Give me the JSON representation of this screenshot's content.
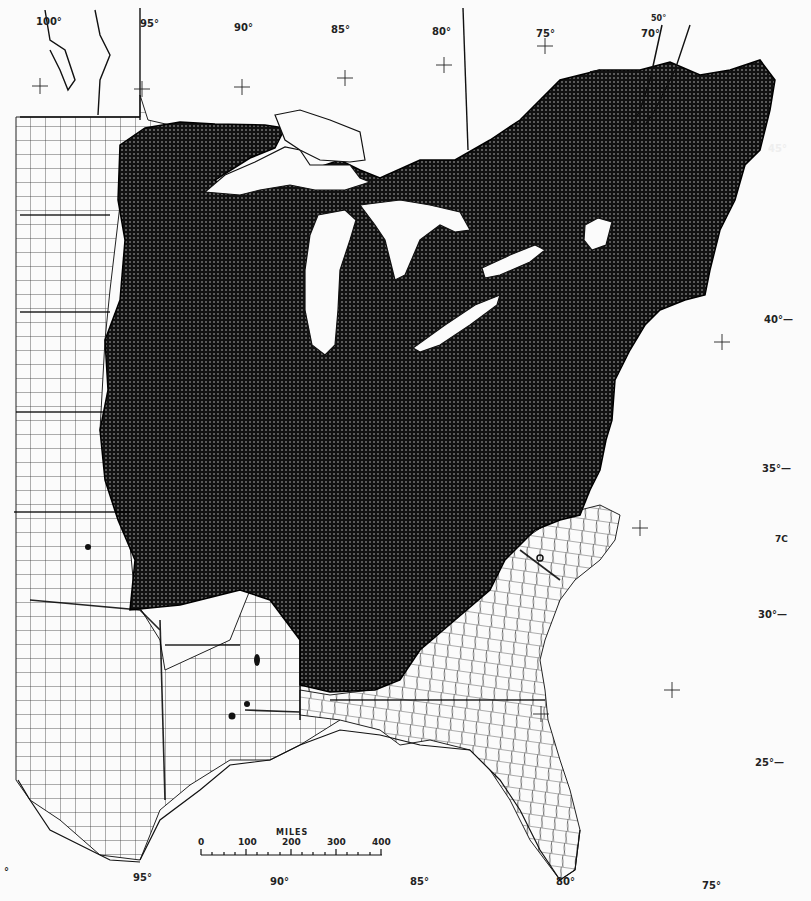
{
  "map": {
    "title": "",
    "subject": "Species distribution range (shaded) in eastern North America",
    "range_fill": "#111111",
    "range_dot_pattern": "#cfcfcf",
    "land_fill": "#fbfbfb",
    "line_color": "#1a1a1a"
  },
  "longitude_labels_top": [
    {
      "label": "100°",
      "x": 36,
      "y": 16
    },
    {
      "label": "95°",
      "x": 140,
      "y": 18
    },
    {
      "label": "90°",
      "x": 234,
      "y": 22
    },
    {
      "label": "85°",
      "x": 331,
      "y": 24
    },
    {
      "label": "80°",
      "x": 432,
      "y": 26
    },
    {
      "label": "75°",
      "x": 536,
      "y": 28
    },
    {
      "label": "70°",
      "x": 641,
      "y": 28
    },
    {
      "label": "50°",
      "x": 651,
      "y": 16
    }
  ],
  "longitude_labels_bottom": [
    {
      "label": "95°",
      "x": 133,
      "y": 872
    },
    {
      "label": "90°",
      "x": 270,
      "y": 876
    },
    {
      "label": "85°",
      "x": 410,
      "y": 876
    },
    {
      "label": "80°",
      "x": 556,
      "y": 876
    },
    {
      "label": "75°",
      "x": 702,
      "y": 880
    },
    {
      "label": "°",
      "x": 4,
      "y": 868
    }
  ],
  "latitude_labels_right": [
    {
      "label": "45°",
      "x": 768,
      "y": 143
    },
    {
      "label": "40°—",
      "x": 764,
      "y": 314
    },
    {
      "label": "35°—",
      "x": 762,
      "y": 463
    },
    {
      "label": "7C",
      "x": 775,
      "y": 534
    },
    {
      "label": "30°—",
      "x": 758,
      "y": 609
    },
    {
      "label": "25°—",
      "x": 755,
      "y": 757
    }
  ],
  "graticule_crosses": [
    {
      "x": 40,
      "y": 86
    },
    {
      "x": 142,
      "y": 89
    },
    {
      "x": 242,
      "y": 87
    },
    {
      "x": 345,
      "y": 78
    },
    {
      "x": 444,
      "y": 65
    },
    {
      "x": 545,
      "y": 46
    },
    {
      "x": 722,
      "y": 342
    },
    {
      "x": 640,
      "y": 528
    },
    {
      "x": 672,
      "y": 690
    },
    {
      "x": 541,
      "y": 714
    },
    {
      "x": 444,
      "y": 66
    }
  ],
  "scale_bar": {
    "title": "MILES",
    "ticks": [
      "0",
      "100",
      "200",
      "300",
      "400"
    ],
    "x": 201,
    "y": 845,
    "width": 181
  },
  "locality_dots": [
    {
      "x": 88,
      "y": 547
    },
    {
      "x": 257,
      "y": 657
    },
    {
      "x": 257,
      "y": 662
    },
    {
      "x": 247,
      "y": 704
    },
    {
      "x": 232,
      "y": 716
    },
    {
      "x": 540,
      "y": 558
    }
  ],
  "regions": [
    "Great Lakes",
    "Lake Superior",
    "Lake Michigan",
    "Lake Huron",
    "Lake Erie",
    "Lake Ontario",
    "Lake Champlain",
    "St. Lawrence River",
    "Florida",
    "Texas",
    "Gulf Coast",
    "Atlantic Coast"
  ]
}
